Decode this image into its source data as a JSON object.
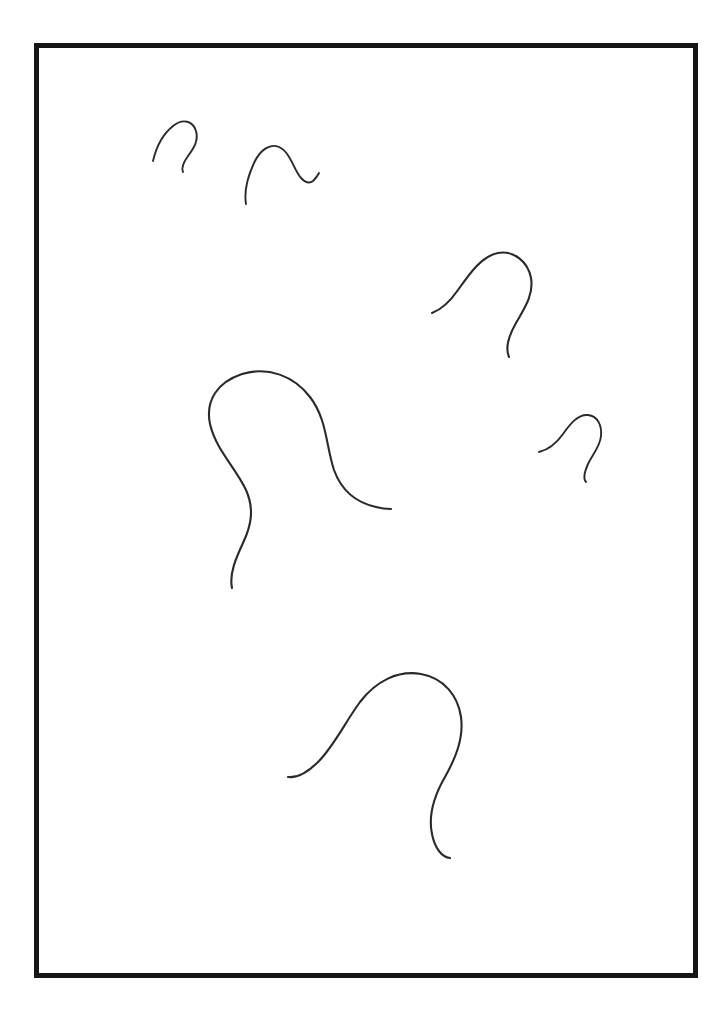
{
  "page": {
    "background_color": "#ffffff",
    "width": 726,
    "height": 1030
  },
  "frame": {
    "name": "border-frame",
    "color": "#161616",
    "thickness_px": 5,
    "left": 34,
    "top": 43,
    "width": 664,
    "height": 935
  },
  "ink": {
    "stroke_color": "#2a2a2a",
    "stroke_width_px": 2.1,
    "style": "hand-drawn single stroke",
    "count": 6
  },
  "strokes": [
    {
      "id": "curve-1",
      "label": "small hook top-left",
      "size": "small",
      "bbox": [
        152,
        120,
        201,
        173
      ],
      "d": "M153,161 C156,148 163,134 173,126 C183,118 193,121 196,131 C199,141 193,149 188,156 C183,163 181,168 183,172"
    },
    {
      "id": "curve-2",
      "label": "small hook with trailing tail",
      "size": "small",
      "bbox": [
        244,
        143,
        320,
        205
      ],
      "d": "M246,204 C244,192 248,176 254,163 C260,150 270,143 279,147 C288,151 292,163 297,172 C302,181 308,185 313,181 C316,178 318,175 319,173"
    },
    {
      "id": "curve-3",
      "label": "medium hook upper-right",
      "size": "medium",
      "bbox": [
        430,
        250,
        536,
        358
      ],
      "d": "M432,313 C440,310 449,303 458,290 C470,273 482,256 498,253 C514,250 528,262 531,278 C534,295 524,309 516,323 C508,337 505,348 509,357"
    },
    {
      "id": "curve-4",
      "label": "large hook center",
      "size": "large",
      "bbox": [
        208,
        371,
        392,
        590
      ],
      "d": "M232,588 C229,574 236,558 243,543 C252,524 254,508 246,490 C236,468 216,450 210,424 C205,400 218,382 242,374 C268,366 294,376 310,397 C327,419 326,446 334,470 C342,492 358,503 376,507 C383,509 388,509 391,509"
    },
    {
      "id": "curve-5",
      "label": "small hook right side",
      "size": "small",
      "bbox": [
        537,
        412,
        603,
        483
      ],
      "d": "M539,452 C547,450 556,444 563,434 C570,424 578,414 588,415 C598,416 602,426 601,436 C600,447 592,455 588,464 C584,473 583,479 586,482"
    },
    {
      "id": "curve-6",
      "label": "large hook bottom",
      "size": "large",
      "bbox": [
        286,
        671,
        466,
        861
      ],
      "d": "M288,777 C296,778 307,773 318,762 C334,746 344,724 360,702 C376,681 398,670 421,674 C444,678 458,696 461,717 C464,739 455,759 445,777 C434,796 428,815 432,834 C435,849 442,857 450,858"
    }
  ]
}
